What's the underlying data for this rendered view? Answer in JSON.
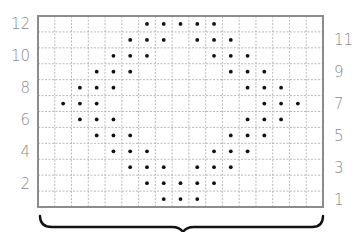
{
  "chart_data": {
    "type": "grid-pattern",
    "title": "",
    "grid": {
      "columns": 17,
      "rows": 12
    },
    "row_labels_left": [
      "12",
      "10",
      "8",
      "6",
      "4",
      "2"
    ],
    "row_labels_right": [
      "11",
      "9",
      "7",
      "5",
      "3",
      "1"
    ],
    "rows": [
      {
        "row": 12,
        "dots": [
          6,
          7,
          8,
          9,
          10
        ]
      },
      {
        "row": 11,
        "dots": [
          5,
          6,
          7,
          9,
          10,
          11
        ]
      },
      {
        "row": 10,
        "dots": [
          4,
          5,
          6,
          10,
          11,
          12
        ]
      },
      {
        "row": 9,
        "dots": [
          3,
          4,
          5,
          11,
          12,
          13
        ]
      },
      {
        "row": 8,
        "dots": [
          2,
          3,
          4,
          12,
          13,
          14
        ]
      },
      {
        "row": 7,
        "dots": [
          1,
          2,
          3,
          13,
          14,
          15
        ]
      },
      {
        "row": 6,
        "dots": [
          2,
          3,
          4,
          12,
          13,
          14
        ]
      },
      {
        "row": 5,
        "dots": [
          3,
          4,
          5,
          11,
          12,
          13
        ]
      },
      {
        "row": 4,
        "dots": [
          4,
          5,
          6,
          10,
          11,
          12
        ]
      },
      {
        "row": 3,
        "dots": [
          5,
          6,
          7,
          9,
          10,
          11
        ]
      },
      {
        "row": 2,
        "dots": [
          6,
          7,
          8,
          9,
          10
        ]
      },
      {
        "row": 1,
        "dots": [
          7,
          8,
          9
        ]
      }
    ],
    "bottom_brace": true
  },
  "colors": {
    "grid_line": "#a8a8a8",
    "border": "#8c8c8c",
    "dot": "#111111",
    "label": "#8a8a8a",
    "brace": "#111111"
  }
}
